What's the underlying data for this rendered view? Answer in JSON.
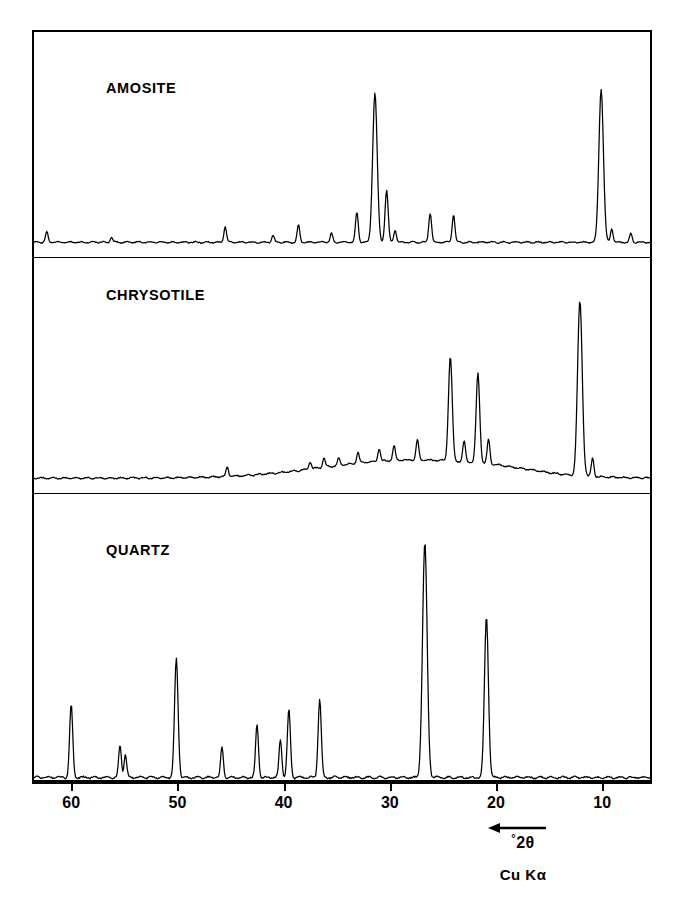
{
  "figure": {
    "axis_caption_degree": "°",
    "axis_caption_theta": "2θ",
    "radiation_label": "Cu Kα",
    "arrow_direction": "left",
    "frame_color": "#000000",
    "trace_color": "#000000",
    "background_color": "#ffffff"
  },
  "panels": [
    {
      "label": "AMOSITE"
    },
    {
      "label": "CHRYSOTILE"
    },
    {
      "label": "QUARTZ"
    }
  ],
  "chart_data": {
    "type": "line",
    "title": "",
    "subtitle": "",
    "xlabel": "°2θ",
    "ylabel": "Intensity (arbitrary units)",
    "xlim": [
      63.5,
      5.5
    ],
    "x_axis_reversed": true,
    "grid": false,
    "legend": "none",
    "annotations": [
      "AMOSITE",
      "CHRYSOTILE",
      "QUARTZ",
      "°2θ",
      "Cu Kα"
    ],
    "xticks": [
      60,
      50,
      40,
      30,
      20,
      10
    ],
    "xticklabels": [
      "60",
      "50",
      "40",
      "30",
      "20",
      "10"
    ],
    "radiation": "Cu Kα",
    "series": [
      {
        "name": "AMOSITE",
        "baseline": 0.0,
        "ylim": [
          0,
          100
        ],
        "peaks": [
          {
            "two_theta": 62.3,
            "intensity": 6
          },
          {
            "two_theta": 56.2,
            "intensity": 3
          },
          {
            "two_theta": 45.5,
            "intensity": 9
          },
          {
            "two_theta": 41.0,
            "intensity": 4
          },
          {
            "two_theta": 38.6,
            "intensity": 10
          },
          {
            "two_theta": 35.5,
            "intensity": 5
          },
          {
            "two_theta": 33.1,
            "intensity": 17
          },
          {
            "two_theta": 31.4,
            "intensity": 86
          },
          {
            "two_theta": 30.3,
            "intensity": 30
          },
          {
            "two_theta": 29.5,
            "intensity": 7
          },
          {
            "two_theta": 26.2,
            "intensity": 17
          },
          {
            "two_theta": 24.0,
            "intensity": 16
          },
          {
            "two_theta": 10.1,
            "intensity": 88
          },
          {
            "two_theta": 9.1,
            "intensity": 8
          },
          {
            "two_theta": 7.3,
            "intensity": 5
          }
        ]
      },
      {
        "name": "CHRYSOTILE",
        "baseline": 0.0,
        "ylim": [
          0,
          100
        ],
        "peaks": [
          {
            "two_theta": 45.3,
            "intensity": 5
          },
          {
            "two_theta": 37.5,
            "intensity": 4
          },
          {
            "two_theta": 36.2,
            "intensity": 5
          },
          {
            "two_theta": 34.8,
            "intensity": 4
          },
          {
            "two_theta": 33.0,
            "intensity": 6
          },
          {
            "two_theta": 31.0,
            "intensity": 7
          },
          {
            "two_theta": 29.6,
            "intensity": 8
          },
          {
            "two_theta": 27.4,
            "intensity": 11
          },
          {
            "two_theta": 24.3,
            "intensity": 56
          },
          {
            "two_theta": 23.0,
            "intensity": 11
          },
          {
            "two_theta": 21.7,
            "intensity": 48
          },
          {
            "two_theta": 20.7,
            "intensity": 13
          },
          {
            "two_theta": 12.1,
            "intensity": 94
          },
          {
            "two_theta": 10.9,
            "intensity": 10
          }
        ]
      },
      {
        "name": "QUARTZ",
        "baseline": 0.0,
        "ylim": [
          0,
          100
        ],
        "peaks": [
          {
            "two_theta": 60.0,
            "intensity": 29
          },
          {
            "two_theta": 55.4,
            "intensity": 13
          },
          {
            "two_theta": 54.9,
            "intensity": 9
          },
          {
            "two_theta": 50.1,
            "intensity": 47
          },
          {
            "two_theta": 45.8,
            "intensity": 12
          },
          {
            "two_theta": 42.5,
            "intensity": 21
          },
          {
            "two_theta": 40.3,
            "intensity": 15
          },
          {
            "two_theta": 39.5,
            "intensity": 27
          },
          {
            "two_theta": 36.6,
            "intensity": 31
          },
          {
            "two_theta": 26.7,
            "intensity": 93
          },
          {
            "two_theta": 20.9,
            "intensity": 64
          }
        ]
      }
    ]
  }
}
